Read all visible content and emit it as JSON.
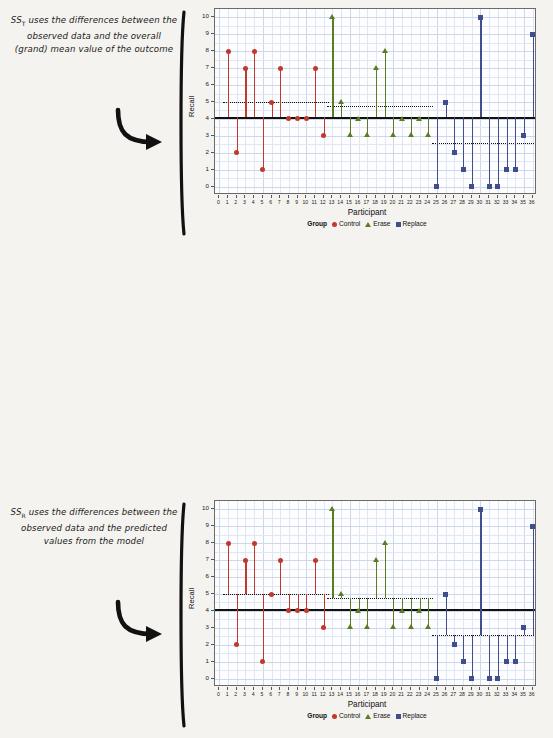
{
  "figure": {
    "colors": {
      "control": "#C0392B",
      "erase": "#5A7D23",
      "replace": "#3F4E8C",
      "grid": "#dfe7f2",
      "mean_line": "#111111",
      "page_bg": "#f4f3ef"
    }
  },
  "panels": [
    {
      "id": "ss-total",
      "annotation": {
        "prefix": "SS",
        "subscript": "T",
        "text": " uses the differences between the observed data and the overall (grand) mean value of the outcome"
      },
      "reference": "grand_mean"
    },
    {
      "id": "ss-residual",
      "annotation": {
        "prefix": "SS",
        "subscript": "R",
        "text": " uses the differences between the observed data and the predicted values from the model"
      },
      "reference": "group_mean"
    },
    {
      "id": "ss-model",
      "annotation": {
        "prefix": "SS",
        "subscript": "M",
        "text": " uses the differences between the mean value of the outcome and the predicted values from the model"
      },
      "reference": "mean_to_group_mean"
    }
  ],
  "chart_data": {
    "type": "scatter",
    "title": "",
    "xlabel": "Participant",
    "ylabel": "Recall",
    "xlim": [
      -0.5,
      36.5
    ],
    "ylim": [
      -0.5,
      10.5
    ],
    "xticks": [
      0,
      1,
      2,
      3,
      4,
      5,
      6,
      7,
      8,
      9,
      10,
      11,
      12,
      13,
      14,
      15,
      16,
      17,
      18,
      19,
      20,
      21,
      22,
      23,
      24,
      25,
      26,
      27,
      28,
      29,
      30,
      31,
      32,
      33,
      34,
      35,
      36
    ],
    "yticks": [
      0,
      1,
      2,
      3,
      4,
      5,
      6,
      7,
      8,
      9,
      10
    ],
    "grid": true,
    "legend_title": "Group",
    "legend_position": "bottom",
    "grand_mean": 4.1,
    "series": [
      {
        "name": "Control",
        "marker": "circle",
        "color": "#C0392B",
        "group_mean": 5.0,
        "x": [
          1,
          2,
          3,
          4,
          5,
          6,
          7,
          8,
          9,
          10,
          11,
          12
        ],
        "y": [
          8,
          2,
          7,
          8,
          1,
          5,
          7,
          4,
          4,
          4,
          7,
          3
        ]
      },
      {
        "name": "Erase",
        "marker": "triangle",
        "color": "#5A7D23",
        "group_mean": 4.75,
        "x": [
          13,
          14,
          15,
          16,
          17,
          18,
          19,
          20,
          21,
          22,
          23,
          24
        ],
        "y": [
          10,
          5,
          3,
          4,
          3,
          7,
          8,
          3,
          4,
          3,
          4,
          3
        ]
      },
      {
        "name": "Replace",
        "marker": "square",
        "color": "#3F4E8C",
        "group_mean": 2.6,
        "x": [
          25,
          26,
          27,
          28,
          29,
          30,
          31,
          32,
          33,
          34,
          35,
          36
        ],
        "y": [
          0,
          5,
          2,
          1,
          0,
          10,
          0,
          0,
          1,
          1,
          3,
          9
        ]
      }
    ]
  }
}
